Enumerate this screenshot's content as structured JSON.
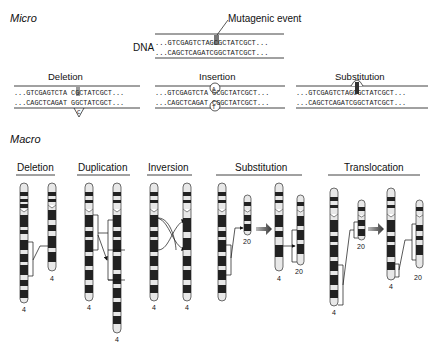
{
  "micro": {
    "title": "Micro",
    "event_label": "Mutagenic event",
    "dna_label": "DNA",
    "original": {
      "top": "...GTCGAGTCTAGCGCTATCGCT...",
      "bottom": "...CAGCTCAGATCGGCTATCGCT..."
    },
    "panels": [
      {
        "title": "Deletion",
        "top": "...GTCGAGTCTA CGCTATCGCT...",
        "bottom": "...CAGCTCAGAT GGCTATCGCT...",
        "marker_base": "C"
      },
      {
        "title": "Insertion",
        "top": "...GTCGAGTCTA GCGCTATCGCT...",
        "bottom": "...CAGCTCAGAT CGGCTATCGCT...",
        "inserted_top": "A",
        "inserted_bottom": "T"
      },
      {
        "title": "Substitution",
        "top": "...GTCGAGTCTAGCGCTATCGCT...",
        "bottom": "...CAGCTCAGATCGGCTATCGCT..."
      }
    ]
  },
  "macro": {
    "title": "Macro",
    "sections": [
      {
        "title": "Deletion",
        "chromosome_labels": [
          "4",
          "4"
        ]
      },
      {
        "title": "Duplication",
        "chromosome_labels": [
          "4",
          "4"
        ]
      },
      {
        "title": "Inversion",
        "chromosome_labels": [
          "4",
          "4"
        ]
      },
      {
        "title": "Substitution",
        "chromosome_labels": [
          "20",
          "4",
          "20"
        ]
      },
      {
        "title": "Translocation",
        "chromosome_labels": [
          "20",
          "4",
          "4",
          "20"
        ]
      }
    ]
  },
  "colors": {
    "ink": "#111111",
    "band_dark": "#222222",
    "band_light": "#e8e8e8",
    "highlight": "#777777"
  }
}
